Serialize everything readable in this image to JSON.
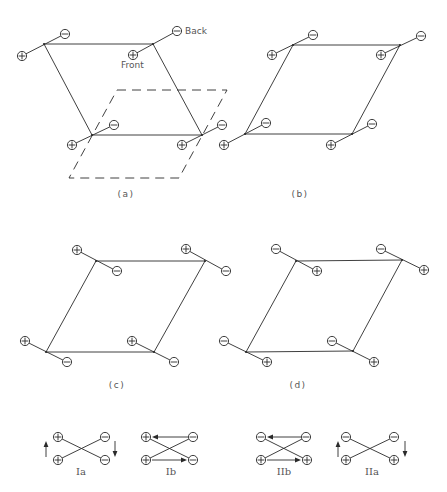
{
  "figure": {
    "panels": [
      {
        "id": "a",
        "label": "(a)",
        "label_pos": [
          126,
          197
        ],
        "annotations": [
          {
            "text": "Back",
            "pos": [
              185,
              34
            ]
          },
          {
            "text": "Front",
            "pos": [
              121,
              68
            ]
          }
        ],
        "solid_polygon": [
          [
            44,
            44
          ],
          [
            153,
            44
          ],
          [
            202,
            135
          ],
          [
            92,
            135
          ]
        ],
        "solid_extra_edge": [
          [
            92,
            135
          ],
          [
            202,
            135
          ]
        ],
        "dashed_polygon": [
          [
            117,
            90
          ],
          [
            227,
            90
          ],
          [
            179,
            178
          ],
          [
            69,
            178
          ]
        ],
        "dipoles": [
          {
            "vertex": [
              44,
              44
            ],
            "plus": [
              22,
              56
            ],
            "minus": [
              65,
              34
            ]
          },
          {
            "vertex": [
              153,
              44
            ],
            "plus": [
              133,
              55
            ],
            "minus": [
              177,
              31
            ]
          },
          {
            "vertex": [
              92,
              135
            ],
            "plus": [
              72,
              145
            ],
            "minus": [
              114,
              125
            ]
          },
          {
            "vertex": [
              202,
              135
            ],
            "plus": [
              182,
              145
            ],
            "minus": [
              222,
              125
            ]
          }
        ]
      },
      {
        "id": "b",
        "label": "(b)",
        "label_pos": [
          300,
          197
        ],
        "solid_polygon": [
          [
            293,
            45
          ],
          [
            400,
            45
          ],
          [
            352,
            134
          ],
          [
            245,
            134
          ]
        ],
        "dipoles": [
          {
            "vertex": [
              293,
              45
            ],
            "plus": [
              272,
              55
            ],
            "minus": [
              313,
              35
            ]
          },
          {
            "vertex": [
              400,
              45
            ],
            "plus": [
              381,
              55
            ],
            "minus": [
              421,
              36
            ]
          },
          {
            "vertex": [
              245,
              134
            ],
            "plus": [
              224,
              145
            ],
            "minus": [
              266,
              123
            ]
          },
          {
            "vertex": [
              352,
              134
            ],
            "plus": [
              331,
              145
            ],
            "minus": [
              372,
              124
            ]
          }
        ]
      },
      {
        "id": "c",
        "label": "(c)",
        "label_pos": [
          117,
          388
        ],
        "solid_polygon": [
          [
            96,
            261
          ],
          [
            205,
            261
          ],
          [
            154,
            352
          ],
          [
            46,
            352
          ]
        ],
        "dipoles": [
          {
            "vertex": [
              96,
              261
            ],
            "plus": [
              77,
              250
            ],
            "minus": [
              117,
              271
            ]
          },
          {
            "vertex": [
              205,
              261
            ],
            "plus": [
              186,
              249
            ],
            "minus": [
              226,
              271
            ]
          },
          {
            "vertex": [
              46,
              352
            ],
            "plus": [
              25,
              341
            ],
            "minus": [
              67,
              362
            ]
          },
          {
            "vertex": [
              154,
              352
            ],
            "plus": [
              132,
              341
            ],
            "minus": [
              174,
              362
            ]
          }
        ]
      },
      {
        "id": "d",
        "label": "(d)",
        "label_pos": [
          298,
          388
        ],
        "solid_polygon": [
          [
            296,
            261
          ],
          [
            402,
            260
          ],
          [
            353,
            351
          ],
          [
            246,
            352
          ]
        ],
        "dipoles": [
          {
            "vertex": [
              296,
              261
            ],
            "plus": [
              317,
              271
            ],
            "minus": [
              276,
              249
            ]
          },
          {
            "vertex": [
              402,
              260
            ],
            "plus": [
              424,
              270
            ],
            "minus": [
              381,
              249
            ]
          },
          {
            "vertex": [
              246,
              352
            ],
            "plus": [
              267,
              362
            ],
            "minus": [
              224,
              341
            ]
          },
          {
            "vertex": [
              353,
              351
            ],
            "plus": [
              374,
              362
            ],
            "minus": [
              332,
              341
            ]
          }
        ]
      }
    ],
    "legend_schemes": [
      {
        "id": "Ia",
        "label": "Ia",
        "label_pos": [
          81,
          475
        ],
        "ions": [
          {
            "sign": "plus",
            "pos": [
              58,
              437
            ]
          },
          {
            "sign": "plus",
            "pos": [
              58,
              460
            ]
          },
          {
            "sign": "minus",
            "pos": [
              105,
              437
            ]
          },
          {
            "sign": "minus",
            "pos": [
              105,
              460
            ]
          }
        ],
        "cross": [
          [
            [
              58,
              437
            ],
            [
              105,
              460
            ]
          ],
          [
            [
              58,
              460
            ],
            [
              105,
              437
            ]
          ]
        ],
        "arrows": [
          {
            "from": [
              46,
              457
            ],
            "to": [
              46,
              441
            ]
          },
          {
            "from": [
              115,
              441
            ],
            "to": [
              115,
              457
            ]
          }
        ]
      },
      {
        "id": "Ib",
        "label": "Ib",
        "label_pos": [
          171,
          475
        ],
        "ions": [
          {
            "sign": "plus",
            "pos": [
              146,
              437
            ]
          },
          {
            "sign": "plus",
            "pos": [
              146,
              460
            ]
          },
          {
            "sign": "minus",
            "pos": [
              193,
              437
            ]
          },
          {
            "sign": "minus",
            "pos": [
              193,
              460
            ]
          }
        ],
        "cross": [
          [
            [
              146,
              437
            ],
            [
              193,
              460
            ]
          ],
          [
            [
              146,
              460
            ],
            [
              193,
              437
            ]
          ]
        ],
        "arrows": [
          {
            "from": [
              188,
              437
            ],
            "to": [
              152,
              437
            ]
          },
          {
            "from": [
              152,
              460
            ],
            "to": [
              187,
              460
            ]
          }
        ]
      },
      {
        "id": "IIb",
        "label": "IIb",
        "label_pos": [
          284,
          475
        ],
        "ions": [
          {
            "sign": "minus",
            "pos": [
              261,
              437
            ]
          },
          {
            "sign": "minus",
            "pos": [
              306,
              437
            ]
          },
          {
            "sign": "plus",
            "pos": [
              261,
              460
            ]
          },
          {
            "sign": "plus",
            "pos": [
              307,
              460
            ]
          }
        ],
        "cross": [
          [
            [
              261,
              437
            ],
            [
              307,
              460
            ]
          ],
          [
            [
              261,
              460
            ],
            [
              306,
              437
            ]
          ]
        ],
        "arrows": [
          {
            "from": [
              301,
              437
            ],
            "to": [
              267,
              437
            ]
          },
          {
            "from": [
              267,
              460
            ],
            "to": [
              301,
              460
            ]
          }
        ]
      },
      {
        "id": "IIa",
        "label": "IIa",
        "label_pos": [
          372,
          475
        ],
        "ions": [
          {
            "sign": "minus",
            "pos": [
              346,
              437
            ]
          },
          {
            "sign": "minus",
            "pos": [
              394,
              437
            ]
          },
          {
            "sign": "plus",
            "pos": [
              346,
              460
            ]
          },
          {
            "sign": "plus",
            "pos": [
              394,
              460
            ]
          }
        ],
        "cross": [
          [
            [
              346,
              437
            ],
            [
              394,
              460
            ]
          ],
          [
            [
              346,
              460
            ],
            [
              394,
              437
            ]
          ]
        ],
        "arrows": [
          {
            "from": [
              338,
              457
            ],
            "to": [
              338,
              441
            ]
          },
          {
            "from": [
              405,
              441
            ],
            "to": [
              405,
              457
            ]
          }
        ]
      }
    ]
  },
  "style": {
    "ion_radius": 4.6,
    "line_color": "#2a2a2a",
    "text_color": "#555555",
    "background": "#ffffff"
  }
}
